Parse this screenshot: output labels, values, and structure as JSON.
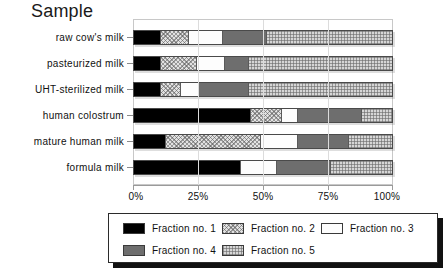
{
  "chart_data": {
    "type": "bar",
    "orientation": "horizontal",
    "stacked": true,
    "normalized_percent": true,
    "title": "Sample",
    "xlabel": "",
    "ylabel": "",
    "xlim": [
      0,
      100
    ],
    "grid": true,
    "legend_position": "bottom",
    "xtick_labels": [
      "0%",
      "25%",
      "50%",
      "75%",
      "100%"
    ],
    "xtick_values": [
      0,
      25,
      50,
      75,
      100
    ],
    "categories": [
      "raw cow's milk",
      "pasteurized milk",
      "UHT-sterilized milk",
      "human colostrum",
      "mature human milk",
      "formula milk"
    ],
    "series": [
      {
        "name": "Fraction no. 1",
        "pattern": "solid-black",
        "values": [
          10,
          10,
          10,
          45,
          12,
          41
        ]
      },
      {
        "name": "Fraction no. 2",
        "pattern": "cross-hatch",
        "values": [
          11,
          14,
          8,
          12,
          37,
          0
        ]
      },
      {
        "name": "Fraction no. 3",
        "pattern": "white",
        "values": [
          13,
          11,
          7,
          6,
          14,
          14
        ]
      },
      {
        "name": "Fraction no. 4",
        "pattern": "gray-solid",
        "values": [
          17,
          9,
          19,
          25,
          20,
          21
        ]
      },
      {
        "name": "Fraction no. 5",
        "pattern": "fine-grid",
        "values": [
          49,
          56,
          56,
          12,
          17,
          24
        ]
      }
    ]
  },
  "legend": {
    "entries": [
      {
        "label": "Fraction no. 1"
      },
      {
        "label": "Fraction no. 2"
      },
      {
        "label": "Fraction no. 3"
      },
      {
        "label": "Fraction no. 4"
      },
      {
        "label": "Fraction no. 5"
      }
    ]
  },
  "colors": {
    "fraction_1": "#000000",
    "fraction_2": "#e2e2e2",
    "fraction_3": "#fdfdfd",
    "fraction_4": "#6e6e6e",
    "fraction_5": "#d6d6d6",
    "axis": "#9a9a9a",
    "text": "#111111"
  }
}
